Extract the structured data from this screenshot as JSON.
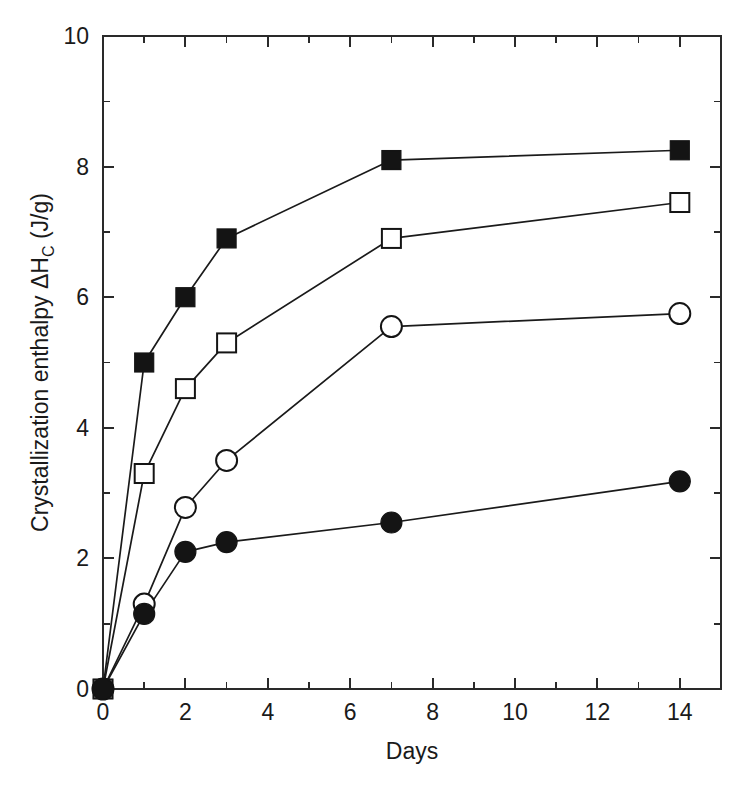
{
  "chart_data": {
    "type": "line",
    "title": "",
    "subtitle": "",
    "xlabel": "Days",
    "ylabel_prefix": "Crystallization enthalpy ",
    "ylabel_delta": "ΔH",
    "ylabel_sub": "C",
    "ylabel_units": " (J/g)",
    "ylabel_full": "Crystallization enthalpy ΔH_C (J/g)",
    "xlim": [
      0,
      15
    ],
    "ylim": [
      0,
      10
    ],
    "x_major_ticks": [
      0,
      2,
      4,
      6,
      8,
      10,
      12,
      14
    ],
    "x_major_tick_labels": [
      "0",
      "2",
      "4",
      "6",
      "8",
      "10",
      "12",
      "14"
    ],
    "x_minor_ticks": [
      1,
      3,
      5,
      7,
      9,
      11,
      13,
      15
    ],
    "y_major_ticks": [
      0,
      2,
      4,
      6,
      8,
      10
    ],
    "y_major_tick_labels": [
      "0",
      "2",
      "4",
      "6",
      "8",
      "10"
    ],
    "y_minor_ticks": [
      1,
      3,
      5,
      7,
      9
    ],
    "grid": false,
    "legend_position": "none",
    "x": [
      0,
      1,
      2,
      3,
      7,
      14
    ],
    "series": [
      {
        "name": "filled-square",
        "marker": "square",
        "fill": "solid",
        "color": "#141414",
        "values": [
          0.0,
          5.0,
          6.0,
          6.9,
          8.1,
          8.25
        ]
      },
      {
        "name": "open-square",
        "marker": "square",
        "fill": "open",
        "color": "#141414",
        "values": [
          0.0,
          3.3,
          4.6,
          5.3,
          6.9,
          7.45
        ]
      },
      {
        "name": "open-circle",
        "marker": "circle",
        "fill": "open",
        "color": "#141414",
        "values": [
          0.0,
          1.3,
          2.78,
          3.5,
          5.55,
          5.75
        ]
      },
      {
        "name": "filled-circle",
        "marker": "circle",
        "fill": "solid",
        "color": "#141414",
        "values": [
          0.0,
          1.15,
          2.1,
          2.25,
          2.55,
          3.18
        ]
      }
    ]
  },
  "colors": {
    "background": "#ffffff",
    "axis": "#2a2a2a",
    "ink": "#141414"
  }
}
